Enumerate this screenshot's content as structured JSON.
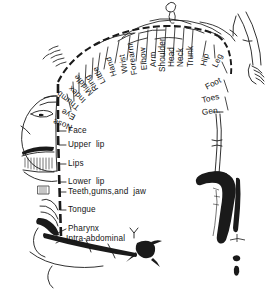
{
  "diagram": {
    "kind": "line-drawing",
    "ink_color": "#1a1a1a",
    "background_color": "#ffffff"
  },
  "arc_labels": [
    {
      "text": "Hip",
      "x": 203.5,
      "y": 62.0,
      "rot": -76
    },
    {
      "text": "Leg",
      "x": 215.0,
      "y": 63.0,
      "rot": -64
    },
    {
      "text": "Foot",
      "x": 206.0,
      "y": 84.0,
      "rot": -28
    },
    {
      "text": "Toes",
      "x": 202.0,
      "y": 97.0,
      "rot": -14
    },
    {
      "text": "Gen.",
      "x": 202.0,
      "y": 109.0,
      "rot": -8
    },
    {
      "text": "Trunk",
      "x": 190.5,
      "y": 62.5,
      "rot": -90
    },
    {
      "text": "Neck",
      "x": 181.0,
      "y": 62.5,
      "rot": -90
    },
    {
      "text": "Head",
      "x": 172.0,
      "y": 62.5,
      "rot": -90
    },
    {
      "text": "Shoulder",
      "x": 163.0,
      "y": 68.0,
      "rot": -90
    },
    {
      "text": "Arm",
      "x": 153.5,
      "y": 62.5,
      "rot": -92
    },
    {
      "text": "Elbow",
      "x": 144.5,
      "y": 65.5,
      "rot": -95
    },
    {
      "text": "Forearm",
      "x": 135.0,
      "y": 70.5,
      "rot": -98
    },
    {
      "text": "Wrist",
      "x": 126.0,
      "y": 68.5,
      "rot": -101
    },
    {
      "text": "Hand",
      "x": 114.5,
      "y": 72.0,
      "rot": -108
    },
    {
      "text": "Little",
      "x": 104.0,
      "y": 79.0,
      "rot": -118
    },
    {
      "text": "Ring",
      "x": 96.5,
      "y": 85.5,
      "rot": -124
    },
    {
      "text": "Middle",
      "x": 91.5,
      "y": 89.5,
      "rot": -130
    },
    {
      "text": "Index",
      "x": 85.0,
      "y": 97.0,
      "rot": -136
    },
    {
      "text": "Thumb",
      "x": 79.0,
      "y": 104.0,
      "rot": -142
    },
    {
      "text": "Eye",
      "x": 74.5,
      "y": 113.0,
      "rot": -152
    },
    {
      "text": "Nose",
      "x": 71.5,
      "y": 122.5,
      "rot": -160
    }
  ],
  "row_labels": [
    {
      "text": "Face",
      "x": 68.0,
      "y": 133.0
    },
    {
      "text": "Upper  lip",
      "x": 68.0,
      "y": 147.0
    },
    {
      "text": "Lips",
      "x": 68.0,
      "y": 166.0
    },
    {
      "text": "Lower  lip",
      "x": 68.0,
      "y": 184.5
    },
    {
      "text": "Teeth,gums,and  jaw",
      "x": 68.0,
      "y": 194.5
    },
    {
      "text": "Tongue",
      "x": 68.0,
      "y": 212.0
    },
    {
      "text": "Pharynx",
      "x": 68.0,
      "y": 231.0
    },
    {
      "text": "Intra-abdominal",
      "x": 66.0,
      "y": 241.0
    }
  ],
  "leader_lines": {
    "note": "short horizontal dashes joining each row label to the cortical strip"
  },
  "body_parts_depicted": [
    "distorted supine body along cortical strip",
    "enlarged face and lips",
    "enlarged hand with fingers",
    "detached leg and foot",
    "detached arm with hand"
  ]
}
